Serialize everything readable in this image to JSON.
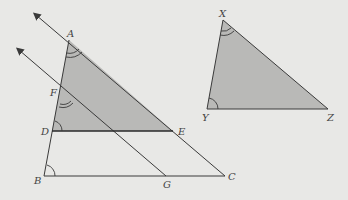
{
  "diagram": {
    "colors": {
      "background": "#e8e8e6",
      "fill": "#b9b9b7",
      "stroke": "#3a3a3a"
    },
    "points": {
      "A": {
        "label": "A",
        "x": 69,
        "y": 40
      },
      "F": {
        "label": "F",
        "x": 62,
        "y": 93
      },
      "D": {
        "label": "D",
        "x": 52,
        "y": 131
      },
      "B": {
        "label": "B",
        "x": 44,
        "y": 176
      },
      "E": {
        "label": "E",
        "x": 173,
        "y": 131
      },
      "G": {
        "label": "G",
        "x": 166,
        "y": 176
      },
      "C": {
        "label": "C",
        "x": 225,
        "y": 176
      },
      "X": {
        "label": "X",
        "x": 223,
        "y": 20
      },
      "Y": {
        "label": "Y",
        "x": 207,
        "y": 109
      },
      "Z": {
        "label": "Z",
        "x": 328,
        "y": 109
      }
    },
    "labels": [
      "A",
      "F",
      "D",
      "B",
      "E",
      "G",
      "C",
      "X",
      "Y",
      "Z"
    ],
    "shaded_triangles": [
      "ADE",
      "XYZ"
    ],
    "parallel_rays": [
      "CA (arrow beyond A)",
      "GF (arrow beyond F)"
    ],
    "angle_marks": {
      "double_arc": [
        "A",
        "F",
        "X"
      ],
      "single_arc": [
        "D",
        "B",
        "Y"
      ]
    }
  }
}
